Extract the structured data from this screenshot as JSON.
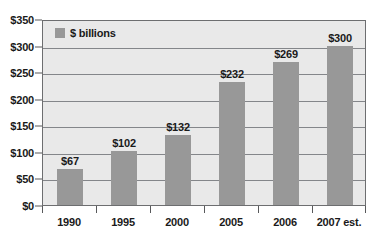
{
  "chart_data": {
    "type": "bar",
    "title": "",
    "subtitle": "",
    "xlabel": "",
    "ylabel": "",
    "categories": [
      "1990",
      "1995",
      "2000",
      "2005",
      "2006",
      "2007 est."
    ],
    "values": [
      67,
      102,
      132,
      232,
      269,
      300
    ],
    "value_labels": [
      "$67",
      "$102",
      "$132",
      "$232",
      "$269",
      "$300"
    ],
    "series": [
      {
        "name": "$ billions",
        "values": [
          67,
          102,
          132,
          232,
          269,
          300
        ],
        "color": "#989898"
      }
    ],
    "ylim": [
      0,
      350
    ],
    "ytick_values": [
      0,
      50,
      100,
      150,
      200,
      250,
      300,
      350
    ],
    "ytick_labels": [
      "$0",
      "$50",
      "$100",
      "$150",
      "$200",
      "$250",
      "$300",
      "$350"
    ],
    "grid": true,
    "legend": {
      "position": "top-left-inside",
      "entries": [
        {
          "label": "$ billions",
          "color": "#989898"
        }
      ]
    },
    "colors": {
      "bar": "#989898",
      "plot_background": "#e9e9e9",
      "gridline": "#84868a",
      "axis": "#58595b",
      "text": "#1a1a1a",
      "figure_background": "#ffffff"
    }
  }
}
